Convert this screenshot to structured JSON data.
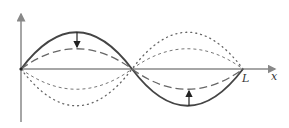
{
  "diagram": {
    "axis_labels": {
      "x": "x",
      "end": "L"
    },
    "colors": {
      "axis": "#888888",
      "solid": "#444444",
      "dashed": "#666666",
      "dotted": "#666666"
    },
    "curves": [
      {
        "name": "solid",
        "style": "solid",
        "amplitude": 37
      },
      {
        "name": "dashed",
        "style": "dashed",
        "amplitude": 20
      },
      {
        "name": "dashed-inverted",
        "style": "dashed",
        "amplitude": -20
      },
      {
        "name": "dotted",
        "style": "dotted",
        "amplitude": -37
      }
    ],
    "arrows": [
      {
        "position": "first-antinode",
        "direction": "down"
      },
      {
        "position": "second-antinode",
        "direction": "up"
      }
    ]
  }
}
